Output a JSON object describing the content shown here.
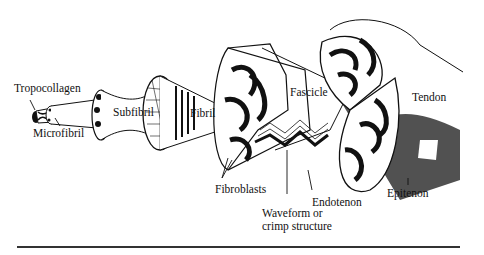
{
  "diagram": {
    "labels": {
      "tropocollagen": "Tropocollagen",
      "microfibril": "Microfibril",
      "subfibril": "Subfibril",
      "fibril": "Fibril",
      "fascicle": "Fascicle",
      "tendon": "Tendon",
      "fibroblasts": "Fibroblasts",
      "waveform_line1": "Waveform or",
      "waveform_line2": "crimp structure",
      "endotenon": "Endotenon",
      "epitenon": "Epitenon"
    },
    "colors": {
      "ink": "#111111",
      "background": "#ffffff",
      "shade": "#444444"
    }
  }
}
